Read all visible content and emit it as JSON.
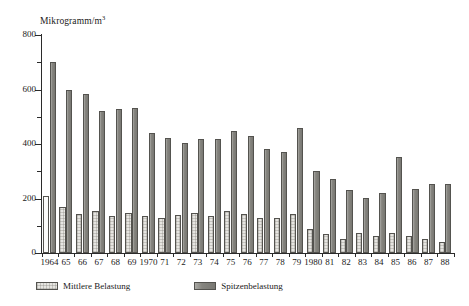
{
  "chart_data": {
    "type": "bar",
    "title": "",
    "subtitle": "",
    "ylabel": "Mikrogramm/m³",
    "xlabel": "",
    "ylim": [
      0,
      800
    ],
    "ytick_major": [
      0,
      200,
      400,
      600,
      800
    ],
    "ytick_minor": [
      100,
      300,
      500,
      700
    ],
    "grid": false,
    "legend_position": "bottom-left",
    "categories": [
      "1964",
      "65",
      "66",
      "67",
      "68",
      "69",
      "1970",
      "71",
      "72",
      "73",
      "74",
      "75",
      "76",
      "77",
      "78",
      "79",
      "1980",
      "81",
      "82",
      "83",
      "84",
      "85",
      "86",
      "87",
      "88"
    ],
    "series": [
      {
        "name": "Mittlere Belastung",
        "color": "#e6e5e1",
        "values": [
          210,
          170,
          143,
          155,
          135,
          148,
          135,
          130,
          138,
          148,
          137,
          155,
          143,
          130,
          127,
          143,
          88,
          70,
          52,
          72,
          62,
          72,
          62,
          50,
          40
        ]
      },
      {
        "name": "Spitzenbelastung",
        "color": "#86857f",
        "values": [
          700,
          600,
          583,
          520,
          530,
          533,
          440,
          422,
          403,
          418,
          420,
          447,
          430,
          380,
          370,
          460,
          300,
          272,
          230,
          203,
          222,
          352,
          235,
          253,
          253
        ]
      }
    ],
    "legend": [
      "Mittlere Belastung",
      "Spitzenbelastung"
    ]
  },
  "axis": {
    "y_title_main": "Mikrogramm/m",
    "y_title_sup": "3"
  },
  "legend": {
    "mid_label": "Mittlere Belastung",
    "peak_label": "Spitzenbelastung"
  }
}
